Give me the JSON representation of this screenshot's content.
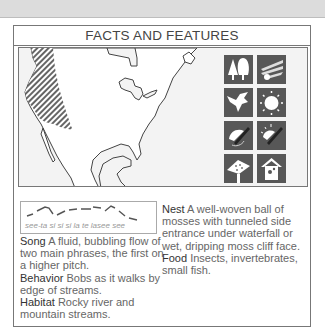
{
  "header": {
    "title": "FACTS AND FEATURES"
  },
  "map": {
    "region": "North America",
    "range_hatched": "Western mountains (Alaska to Mexico)"
  },
  "icons": [
    {
      "name": "woodland-trees-icon",
      "label": "Trees"
    },
    {
      "name": "waterfall-spray-icon",
      "label": "Waterfall"
    },
    {
      "name": "flying-bird-icon",
      "label": "Bird in flight"
    },
    {
      "name": "sun-icon",
      "label": "Sun"
    },
    {
      "name": "nest-cup-icon",
      "label": "Nest"
    },
    {
      "name": "nest-sun-icon",
      "label": "Nest with sun"
    },
    {
      "name": "bird-feeder-icon",
      "label": "Feeder"
    },
    {
      "name": "birdhouse-icon",
      "label": "Birdhouse"
    }
  ],
  "song_sonogram": {
    "caption": "see-ta si si si la te lasee see"
  },
  "facts": {
    "song": {
      "label": "Song",
      "text": "A fluid, bubbling flow of two main phrases, the first on a higher pitch."
    },
    "behavior": {
      "label": "Behavior",
      "text": "Bobs as it walks by edge of streams."
    },
    "habitat": {
      "label": "Habitat",
      "text": "Rocky river and mountain streams."
    },
    "nest": {
      "label": "Nest",
      "text": "A well-woven ball of mosses with tunneled side entrance under waterfall or wet, dripping moss cliff face."
    },
    "food": {
      "label": "Food",
      "text": "Insects, invertebrates, small fish."
    }
  },
  "colors": {
    "tile_bg": "#575757",
    "border": "#777777",
    "topband": "#dcdcdc",
    "ocean": "#f3f3f3"
  }
}
